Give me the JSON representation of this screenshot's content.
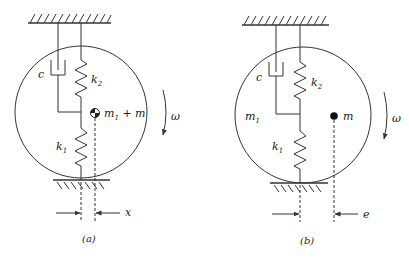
{
  "figures": [
    {
      "id": "a",
      "caption": "(a)",
      "labels": {
        "damper": "c",
        "upper_spring": "k",
        "upper_spring_sub": "2",
        "lower_spring": "k",
        "lower_spring_sub": "1",
        "mass": "m",
        "mass_sub": "1",
        "mass_suffix": " + m",
        "rotation": "ω",
        "offset": "x"
      },
      "mass_marker": "center-of-mass-symbol"
    },
    {
      "id": "b",
      "caption": "(b)",
      "labels": {
        "damper": "c",
        "upper_spring": "k",
        "upper_spring_sub": "2",
        "lower_spring": "k",
        "lower_spring_sub": "1",
        "disk_mass": "m",
        "disk_mass_sub": "1",
        "point_mass": "m",
        "rotation": "ω",
        "offset": "e"
      },
      "mass_marker": "point-mass-dot"
    }
  ],
  "colors": {
    "line": "#333333",
    "background": "#ffffff"
  }
}
